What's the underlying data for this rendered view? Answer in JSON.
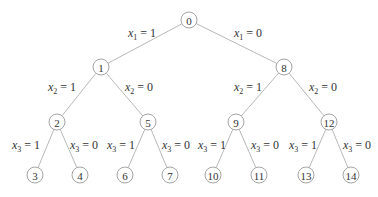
{
  "diagram": {
    "type": "binary-tree",
    "nodes": [
      {
        "id": "0",
        "x": 189,
        "y": 20
      },
      {
        "id": "1",
        "x": 101,
        "y": 67
      },
      {
        "id": "8",
        "x": 284,
        "y": 67
      },
      {
        "id": "2",
        "x": 57,
        "y": 122
      },
      {
        "id": "5",
        "x": 148,
        "y": 122
      },
      {
        "id": "9",
        "x": 236,
        "y": 122
      },
      {
        "id": "12",
        "x": 329,
        "y": 122
      },
      {
        "id": "3",
        "x": 35,
        "y": 175
      },
      {
        "id": "4",
        "x": 80,
        "y": 175
      },
      {
        "id": "6",
        "x": 125,
        "y": 175
      },
      {
        "id": "7",
        "x": 170,
        "y": 175
      },
      {
        "id": "10",
        "x": 213,
        "y": 175
      },
      {
        "id": "11",
        "x": 259,
        "y": 175
      },
      {
        "id": "13",
        "x": 306,
        "y": 175
      },
      {
        "id": "14",
        "x": 351,
        "y": 175
      }
    ],
    "edges": [
      {
        "from": "0",
        "to": "1",
        "var": "x",
        "sub": "1",
        "val": "1",
        "lx": 128,
        "ly": 37
      },
      {
        "from": "0",
        "to": "8",
        "var": "x",
        "sub": "1",
        "val": "0",
        "lx": 234,
        "ly": 37
      },
      {
        "from": "1",
        "to": "2",
        "var": "x",
        "sub": "2",
        "val": "1",
        "lx": 48,
        "ly": 91
      },
      {
        "from": "1",
        "to": "5",
        "var": "x",
        "sub": "2",
        "val": "0",
        "lx": 125,
        "ly": 91
      },
      {
        "from": "8",
        "to": "9",
        "var": "x",
        "sub": "2",
        "val": "1",
        "lx": 234,
        "ly": 91
      },
      {
        "from": "8",
        "to": "12",
        "var": "x",
        "sub": "2",
        "val": "0",
        "lx": 309,
        "ly": 91
      },
      {
        "from": "2",
        "to": "3",
        "var": "x",
        "sub": "3",
        "val": "1",
        "lx": 12,
        "ly": 149
      },
      {
        "from": "2",
        "to": "4",
        "var": "x",
        "sub": "3",
        "val": "0",
        "lx": 70,
        "ly": 149
      },
      {
        "from": "5",
        "to": "6",
        "var": "x",
        "sub": "3",
        "val": "1",
        "lx": 107,
        "ly": 149
      },
      {
        "from": "5",
        "to": "7",
        "var": "x",
        "sub": "3",
        "val": "0",
        "lx": 162,
        "ly": 149
      },
      {
        "from": "9",
        "to": "10",
        "var": "x",
        "sub": "3",
        "val": "1",
        "lx": 198,
        "ly": 149
      },
      {
        "from": "9",
        "to": "11",
        "var": "x",
        "sub": "3",
        "val": "0",
        "lx": 251,
        "ly": 149
      },
      {
        "from": "12",
        "to": "13",
        "var": "x",
        "sub": "3",
        "val": "1",
        "lx": 289,
        "ly": 149
      },
      {
        "from": "12",
        "to": "14",
        "var": "x",
        "sub": "3",
        "val": "0",
        "lx": 343,
        "ly": 149
      }
    ]
  }
}
